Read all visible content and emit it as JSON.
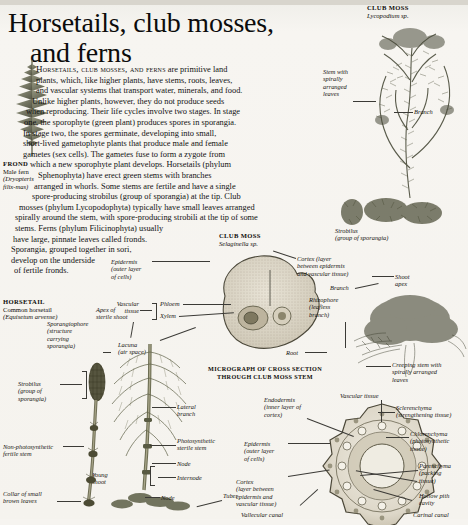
{
  "page": {
    "title_line1": "Horsetails, club mosses,",
    "title_line2": "and ferns"
  },
  "body": {
    "lead": "Horsetails, club mosses, and ferns",
    "lines": [
      " are primitive land",
      "plants, which, like higher plants, have stems, roots, leaves,",
      "and vascular systems that transport water, minerals, and food.",
      "Unlike higher plants, however, they do not produce seeds",
      "when reproducing. Their life cycles involve two stages. In stage",
      "one, the sporophyte (green plant) produces spores in sporangia.",
      "In stage two, the spores germinate, developing into small,",
      "short-lived gametophyte plants that produce male and female",
      "gametes (sex cells). The gametes fuse to form a zygote from",
      "which a new sporophyte plant develops. Horsetails (phylum",
      "Sphenophyta) have erect green stems with branches",
      "arranged in whorls. Some stems are fertile and have a single",
      "spore-producing strobilus (group of sporangia) at the tip. Club",
      "mosses (phylum Lycopodophyta) typically have small leaves arranged",
      "spirally around the stem, with spore-producing strobili at the tip of some",
      "stems. Ferns (phylum Filicinophyta) usually",
      "have large, pinnate leaves called fronds.",
      "Sporangia, grouped together in sori,",
      "develop on the underside",
      "of fertile fronds."
    ]
  },
  "frond": {
    "title": "FROND",
    "common": "Male fern",
    "latin_line1": "(Dryopteris",
    "latin_line2": "filix-mas)"
  },
  "club_moss_lycopodium": {
    "title": "CLUB MOSS",
    "latin": "Lycopodium sp.",
    "labels": {
      "stem": "Stem with\nspirally\narranged\nleaves",
      "stem_l1": "Stem with",
      "stem_l2": "spirally",
      "stem_l3": "arranged",
      "stem_l4": "leaves",
      "branch": "Branch",
      "strobilus_l1": "Strobilus",
      "strobilus_l2": "(group of sporangia)"
    }
  },
  "club_moss_selaginella": {
    "title": "CLUB MOSS",
    "latin": "Selaginella sp.",
    "labels": {
      "epidermis_l1": "Epidermis",
      "epidermis_l2": "(outer layer",
      "epidermis_l3": "of cells)",
      "cortex_l1": "Cortex (layer",
      "cortex_l2": "between epidermis",
      "cortex_l3": "and vascular tissue)",
      "vascular_l1": "Vascular",
      "vascular_l2": "tissue",
      "phloem": "Phloem",
      "xylem": "Xylem",
      "lacuna_l1": "Lacuna",
      "lacuna_l2": "(air space)",
      "root": "Root",
      "shoot_apex_l1": "Shoot",
      "shoot_apex_l2": "apex",
      "branch": "Branch",
      "rhizophore_l1": "Rhizophore",
      "rhizophore_l2": "(leafless",
      "rhizophore_l3": "branch)",
      "creeping_l1": "Creeping stem with",
      "creeping_l2": "spirally arranged",
      "creeping_l3": "leaves"
    },
    "caption_l1": "MICROGRAPH OF CROSS SECTION",
    "caption_l2": "THROUGH CLUB MOSS STEM"
  },
  "horsetail": {
    "title": "HORSETAIL",
    "common": "Common horsetail",
    "latin": "(Equisetum arvense)",
    "labels": {
      "apex_l1": "Apex of",
      "apex_l2": "sterile shoot",
      "sporangiophore_l1": "Sporangiophore",
      "sporangiophore_l2": "(structure",
      "sporangiophore_l3": "carrying",
      "sporangiophore_l4": "sporangia)",
      "strobilus_l1": "Strobilus",
      "strobilus_l2": "(group of",
      "strobilus_l3": "sporangia)",
      "fertile_stem_l1": "Non-photosynthetic",
      "fertile_stem_l2": "fertile stem",
      "collar_l1": "Collar of small",
      "collar_l2": "brown leaves",
      "young_shoot_l1": "Young",
      "young_shoot_l2": "shoot",
      "lateral_branch_l1": "Lateral",
      "lateral_branch_l2": "branch",
      "photo_stem_l1": "Photosynthetic",
      "photo_stem_l2": "sterile stem",
      "node_upper": "Node",
      "internode": "Internode",
      "node_lower": "Node",
      "tuber": "Tuber"
    }
  },
  "horsetail_section": {
    "labels": {
      "endodermis_l1": "Endodermis",
      "endodermis_l2": "(inner layer of",
      "endodermis_l3": "cortex)",
      "epidermis_l1": "Epidermis",
      "epidermis_l2": "(outer layer",
      "epidermis_l3": "of cells)",
      "cortex_l1": "Cortex",
      "cortex_l2": "(layer between",
      "cortex_l3": "epidermis and",
      "cortex_l4": "vascular tissue)",
      "vallecular": "Vallecular canal",
      "vascular_tissue": "Vascular tissue",
      "sclerenchyma_l1": "Sclerenchyma",
      "sclerenchyma_l2": "(strengthening tissue)",
      "chlorenchyma_l1": "Chlorenchyma",
      "chlorenchyma_l2": "(photosynthetic",
      "chlorenchyma_l3": "tissue)",
      "parenchyma_l1": "Parenchyma",
      "parenchyma_l2": "(packing",
      "parenchyma_l3": "tissue)",
      "pith_l1": "Hollow pith",
      "pith_l2": "cavity",
      "carinal": "Carinal canal"
    }
  },
  "colors": {
    "paper": "#f5f3ee",
    "ink": "#15130f",
    "plant_dark": "#3f4033",
    "plant_mid": "#6d6e5c",
    "plant_light": "#9b9c89",
    "section_fill": "#d9d4c8"
  }
}
